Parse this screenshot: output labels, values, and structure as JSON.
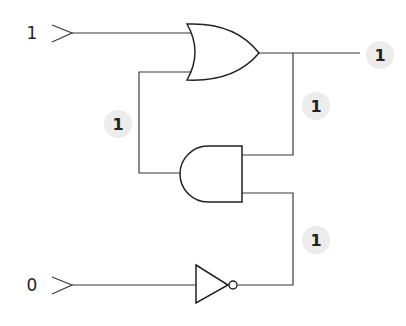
{
  "diagram": {
    "type": "logic-circuit",
    "inputs": [
      {
        "id": "A",
        "value": "1",
        "x": 32,
        "y": 33
      },
      {
        "id": "B",
        "value": "0",
        "x": 32,
        "y": 285
      }
    ],
    "gates": [
      {
        "id": "or1",
        "type": "OR"
      },
      {
        "id": "and1",
        "type": "AND"
      },
      {
        "id": "not1",
        "type": "NOT"
      }
    ],
    "signal_badges": [
      {
        "id": "output",
        "value": "1",
        "x": 380,
        "y": 55
      },
      {
        "id": "or-to-and",
        "value": "1",
        "x": 316,
        "y": 106
      },
      {
        "id": "and-feedback",
        "value": "1",
        "x": 118,
        "y": 124
      },
      {
        "id": "not-to-and",
        "value": "1",
        "x": 316,
        "y": 240
      }
    ],
    "colors": {
      "line": "#222222",
      "badge_bg": "#ececec"
    }
  }
}
